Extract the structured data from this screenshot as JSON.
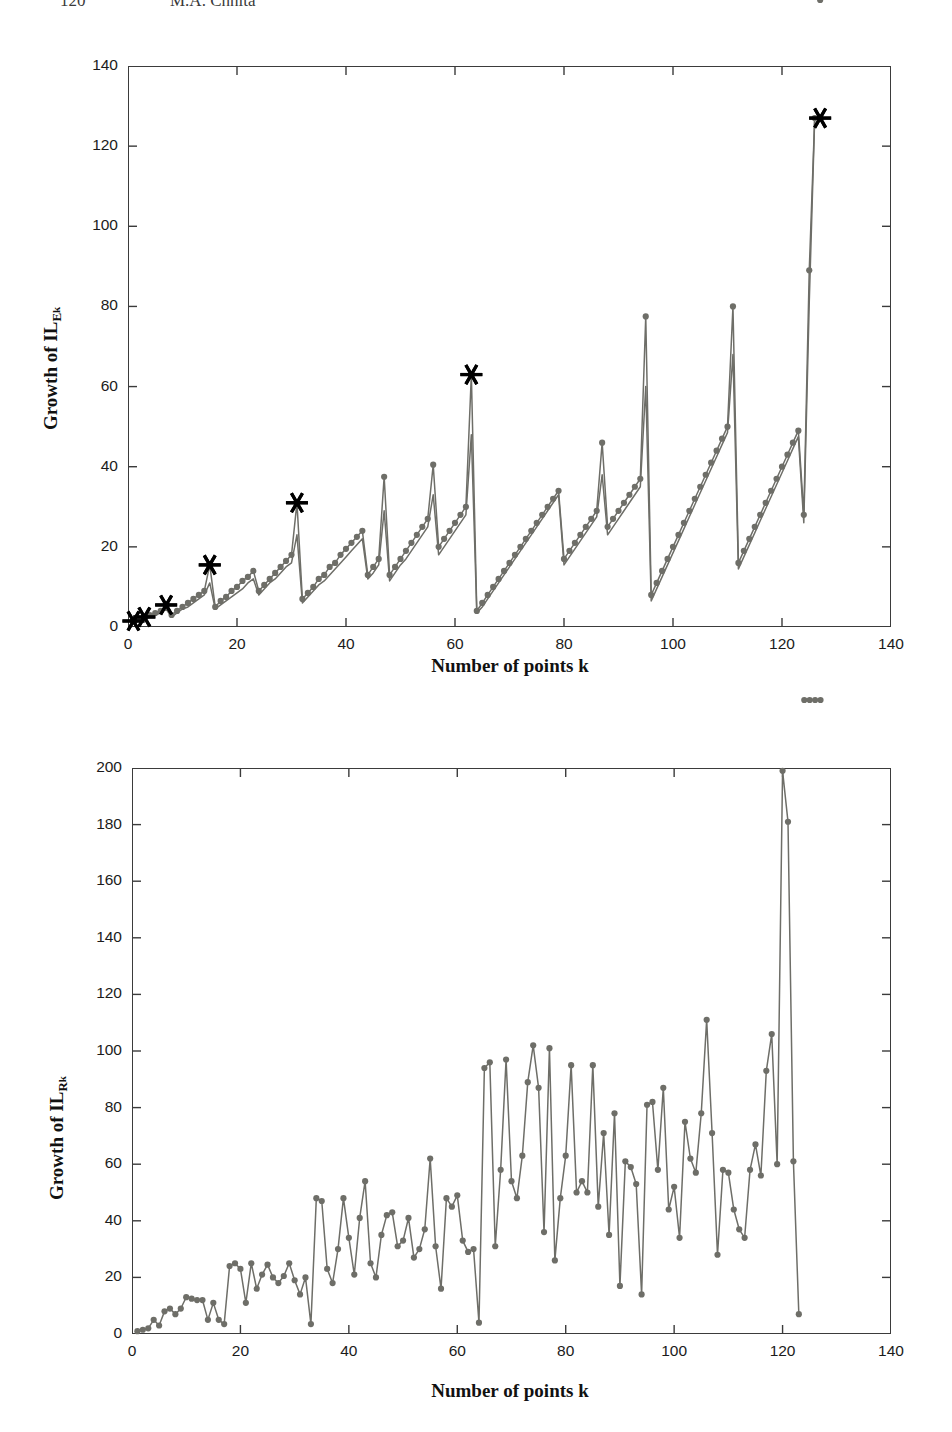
{
  "page": {
    "running_header": {
      "folio": "120",
      "author": "M.A. Chhita"
    },
    "width": 952,
    "height": 1432,
    "background": "#ffffff"
  },
  "style": {
    "series_color": "#6e6e68",
    "marker_color": "#6e6e68",
    "star_color": "#000000",
    "axis_color": "#3b3b3b",
    "text_color": "#111111"
  },
  "chart_data": [
    {
      "id": "chart-top",
      "type": "line",
      "title": "",
      "xlabel": "Number of points k",
      "ylabel": "Growth of IL",
      "ylabel_sub": "E",
      "ylabel_subsub": "k",
      "ylabel_full": "Growth of IL_E_k",
      "xlim": [
        0,
        140
      ],
      "ylim": [
        0,
        140
      ],
      "xticks": [
        0,
        20,
        40,
        60,
        80,
        100,
        120,
        140
      ],
      "yticks": [
        0,
        20,
        40,
        60,
        80,
        100,
        120,
        140
      ],
      "grid": false,
      "legend": "none",
      "series": [
        {
          "name": "IL_Ek upper (markers)",
          "marker": "dot",
          "x": [
            1,
            2,
            3,
            4,
            5,
            6,
            7,
            8,
            9,
            10,
            11,
            12,
            13,
            14,
            15,
            16,
            17,
            18,
            19,
            20,
            21,
            22,
            23,
            24,
            25,
            26,
            27,
            28,
            29,
            30,
            31,
            32,
            33,
            34,
            35,
            36,
            37,
            38,
            39,
            40,
            41,
            42,
            43,
            44,
            45,
            46,
            47,
            48,
            49,
            50,
            51,
            52,
            53,
            54,
            55,
            56,
            57,
            58,
            59,
            60,
            61,
            62,
            63,
            64,
            65,
            66,
            67,
            68,
            69,
            70,
            71,
            72,
            73,
            74,
            75,
            76,
            77,
            78,
            79,
            80,
            81,
            82,
            83,
            84,
            85,
            86,
            87,
            88,
            89,
            90,
            91,
            92,
            93,
            94,
            95,
            96,
            97,
            98,
            99,
            100,
            101,
            102,
            103,
            104,
            105,
            106,
            107,
            108,
            109,
            110,
            111,
            112,
            113,
            114,
            115,
            116,
            117,
            118,
            119,
            120,
            121,
            122,
            123,
            124,
            125,
            126,
            127
          ],
          "y": [
            1.5,
            2,
            2.5,
            3,
            3.5,
            4,
            5.5,
            3,
            4,
            5,
            6,
            7,
            8,
            9,
            15.5,
            5,
            6.5,
            7.5,
            9,
            10,
            11.5,
            12.5,
            14,
            9,
            10.5,
            12,
            13.5,
            15,
            16.5,
            18,
            31,
            7,
            8.5,
            10,
            12,
            13,
            15,
            16,
            18,
            19.5,
            21,
            22.5,
            24,
            13,
            15,
            17,
            37.5,
            13,
            15,
            17,
            19,
            21,
            23,
            25,
            27,
            40.5,
            20,
            22,
            24,
            26,
            28,
            30,
            63,
            4,
            6,
            8,
            10,
            12,
            14,
            16,
            18,
            20,
            22,
            24,
            26,
            28,
            30,
            32,
            34,
            17,
            19,
            21,
            23,
            25,
            27,
            29,
            46,
            25,
            27,
            29,
            31,
            33,
            35,
            37,
            77.5,
            8,
            11,
            14,
            17,
            20,
            23,
            26,
            29,
            32,
            35,
            38,
            41,
            44,
            47,
            50,
            80,
            16,
            19,
            22,
            25,
            28,
            31,
            34,
            37,
            40,
            43,
            46,
            49,
            28,
            89,
            127
          ],
          "y_estimated": true
        },
        {
          "name": "IL_Ek lower (step line)",
          "marker": "none",
          "x": [
            1,
            2,
            3,
            4,
            5,
            6,
            7,
            8,
            9,
            10,
            11,
            12,
            13,
            14,
            15,
            16,
            17,
            18,
            19,
            20,
            21,
            22,
            23,
            24,
            25,
            26,
            27,
            28,
            29,
            30,
            31,
            32,
            33,
            34,
            35,
            36,
            37,
            38,
            39,
            40,
            41,
            42,
            43,
            44,
            45,
            46,
            47,
            48,
            49,
            50,
            51,
            52,
            53,
            54,
            55,
            56,
            57,
            58,
            59,
            60,
            61,
            62,
            63,
            64,
            65,
            66,
            67,
            68,
            69,
            70,
            71,
            72,
            73,
            74,
            75,
            76,
            77,
            78,
            79,
            80,
            81,
            82,
            83,
            84,
            85,
            86,
            87,
            88,
            89,
            90,
            91,
            92,
            93,
            94,
            95,
            96,
            97,
            98,
            99,
            100,
            101,
            102,
            103,
            104,
            105,
            106,
            107,
            108,
            109,
            110,
            111,
            112,
            113,
            114,
            115,
            116,
            117,
            118,
            119,
            120,
            121,
            122,
            123,
            124,
            125,
            126,
            127
          ],
          "y": [
            1,
            1.5,
            2,
            2.5,
            3,
            3.5,
            4.5,
            2.5,
            3.5,
            4.5,
            5,
            6,
            7,
            8,
            11,
            4.5,
            5.5,
            6.5,
            7.5,
            8.5,
            9.5,
            11,
            12,
            8,
            9.5,
            11,
            12,
            13.5,
            15,
            16,
            23,
            6,
            7.5,
            9,
            10.5,
            11.5,
            13,
            14.5,
            16,
            17.5,
            19,
            20.5,
            22,
            12,
            13.5,
            15.5,
            29,
            11.5,
            13.5,
            15.5,
            17,
            19,
            21,
            23,
            25,
            33,
            18,
            20,
            22,
            24,
            26,
            28,
            48,
            3.5,
            5,
            7,
            9,
            11,
            13,
            15,
            17,
            19,
            21,
            23,
            25,
            27,
            29,
            31,
            33,
            15.5,
            17.5,
            19.5,
            21.5,
            23.5,
            25.5,
            27.5,
            38,
            23,
            25,
            27,
            29,
            31,
            33,
            35,
            60,
            6.5,
            9.5,
            12.5,
            15.5,
            18.5,
            21.5,
            24.5,
            27.5,
            30.5,
            33.5,
            36.5,
            39.5,
            42.5,
            45.5,
            48.5,
            68,
            14.5,
            17.5,
            20.5,
            23.5,
            26.5,
            29.5,
            32.5,
            35.5,
            38.5,
            41.5,
            44.5,
            47.5,
            26,
            81,
            127
          ],
          "y_estimated": true
        }
      ],
      "star_markers": {
        "name": "power-of-two peaks",
        "symbol": "*",
        "x": [
          1,
          3,
          7,
          15,
          31,
          63,
          127
        ],
        "y": [
          1.5,
          2.5,
          5.5,
          15.5,
          31,
          63,
          127
        ]
      }
    },
    {
      "id": "chart-bottom",
      "type": "line",
      "title": "",
      "xlabel": "Number of points k",
      "ylabel": "Growth of IL",
      "ylabel_sub": "R",
      "ylabel_subsub": "k",
      "ylabel_full": "Growth of IL_R_k",
      "xlim": [
        0,
        140
      ],
      "ylim": [
        0,
        200
      ],
      "xticks": [
        0,
        20,
        40,
        60,
        80,
        100,
        120,
        140
      ],
      "yticks": [
        0,
        20,
        40,
        60,
        80,
        100,
        120,
        140,
        160,
        180,
        200
      ],
      "grid": false,
      "legend": "none",
      "series": [
        {
          "name": "IL_Rk",
          "marker": "dot",
          "x": [
            1,
            2,
            3,
            4,
            5,
            6,
            7,
            8,
            9,
            10,
            11,
            12,
            13,
            14,
            15,
            16,
            17,
            18,
            19,
            20,
            21,
            22,
            23,
            24,
            25,
            26,
            27,
            28,
            29,
            30,
            31,
            32,
            33,
            34,
            35,
            36,
            37,
            38,
            39,
            40,
            41,
            42,
            43,
            44,
            45,
            46,
            47,
            48,
            49,
            50,
            51,
            52,
            53,
            54,
            55,
            56,
            57,
            58,
            59,
            60,
            61,
            62,
            63,
            64,
            65,
            66,
            67,
            68,
            69,
            70,
            71,
            72,
            73,
            74,
            75,
            76,
            77,
            78,
            79,
            80,
            81,
            82,
            83,
            84,
            85,
            86,
            87,
            88,
            89,
            90,
            91,
            92,
            93,
            94,
            95,
            96,
            97,
            98,
            99,
            100,
            101,
            102,
            103,
            104,
            105,
            106,
            107,
            108,
            109,
            110,
            111,
            112,
            113,
            114,
            115,
            116,
            117,
            118,
            119,
            120,
            121,
            122,
            123,
            124,
            125,
            126,
            127
          ],
          "y": [
            1,
            1.5,
            2,
            5,
            3,
            8,
            9,
            7,
            9,
            13,
            12.5,
            12,
            12,
            5,
            11,
            5,
            3.5,
            24,
            25,
            23,
            11,
            25,
            16,
            21,
            24.5,
            20,
            18,
            20.5,
            25,
            19,
            14,
            20,
            3.5,
            48,
            47,
            23,
            18,
            30,
            48,
            34,
            21,
            41,
            54,
            25,
            20,
            35,
            42,
            43,
            31,
            33,
            41,
            27,
            30,
            37,
            62,
            31,
            16,
            48,
            45,
            49,
            33,
            29,
            30,
            4,
            94,
            96,
            31,
            58,
            97,
            54,
            48,
            63,
            89,
            102,
            87,
            36,
            101,
            26,
            48,
            63,
            95,
            50,
            54,
            50,
            95,
            45,
            71,
            35,
            78,
            17,
            61,
            59,
            53,
            14,
            81,
            82,
            58,
            87,
            44,
            52,
            34,
            75,
            62,
            57,
            78,
            111,
            71,
            28,
            58,
            57,
            44,
            37,
            34,
            58,
            67,
            56,
            93,
            106,
            60,
            199,
            181,
            61,
            7
          ],
          "y_estimated": true
        }
      ]
    }
  ]
}
